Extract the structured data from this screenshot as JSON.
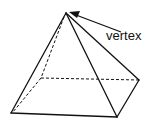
{
  "diagram": {
    "labels": {
      "vertex": "vertex"
    },
    "colors": {
      "stroke": "#111111",
      "background": "#ffffff"
    },
    "points": {
      "apex": [
        66,
        13
      ],
      "front_left": [
        11,
        113
      ],
      "front_right": [
        117,
        117
      ],
      "back_right": [
        139,
        80
      ],
      "back_left": [
        41,
        78
      ]
    },
    "edges": {
      "visible": [
        [
          "apex",
          "front_left"
        ],
        [
          "apex",
          "front_right"
        ],
        [
          "apex",
          "back_right"
        ],
        [
          "front_left",
          "front_right"
        ],
        [
          "front_right",
          "back_right"
        ]
      ],
      "hidden": [
        [
          "apex",
          "back_left"
        ],
        [
          "back_left",
          "back_right"
        ],
        [
          "back_left",
          "front_left"
        ]
      ]
    },
    "arrow": {
      "from": [
        121,
        32
      ],
      "to": [
        70,
        13
      ]
    }
  }
}
